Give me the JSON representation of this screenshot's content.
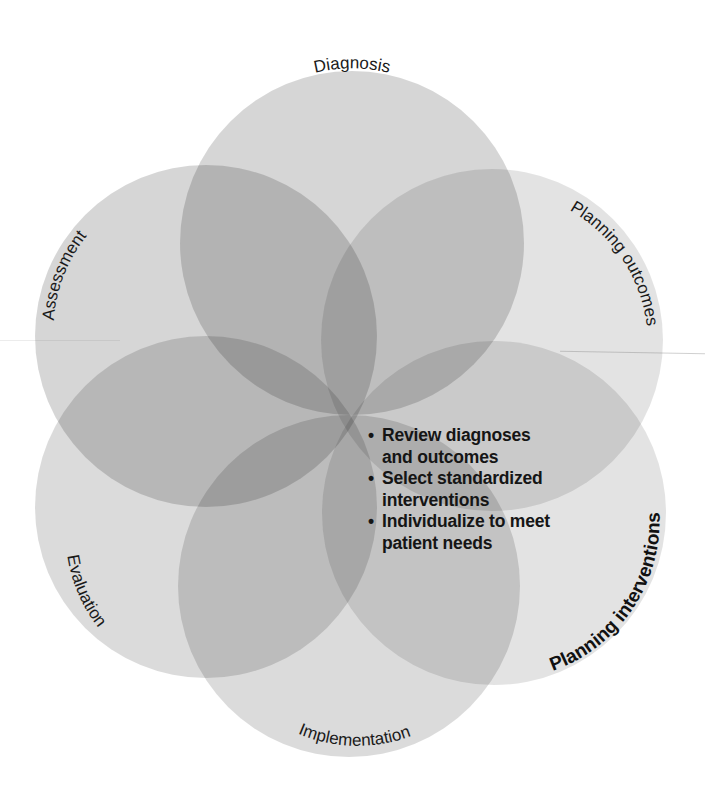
{
  "diagram": {
    "type": "overlapping-circles-rosette",
    "circles": [
      {
        "id": "diagnosis",
        "label": "Diagnosis",
        "cx": 352,
        "cy": 243,
        "r": 172,
        "opacity": 0.16,
        "emphasis": false
      },
      {
        "id": "planning-outcomes",
        "label": "Planning outcomes",
        "cx": 492,
        "cy": 340,
        "r": 171,
        "opacity": 0.11,
        "emphasis": false
      },
      {
        "id": "planning-interventions",
        "label": "Planning interventions",
        "cx": 494,
        "cy": 513,
        "r": 172,
        "opacity": 0.11,
        "emphasis": true
      },
      {
        "id": "implementation",
        "label": "Implementation",
        "cx": 349,
        "cy": 586,
        "r": 171,
        "opacity": 0.14,
        "emphasis": false
      },
      {
        "id": "evaluation",
        "label": "Evaluation",
        "cx": 206,
        "cy": 507,
        "r": 171,
        "opacity": 0.14,
        "emphasis": false
      },
      {
        "id": "assessment",
        "label": "Assessment",
        "cx": 206,
        "cy": 336,
        "r": 171,
        "opacity": 0.16,
        "emphasis": false
      }
    ],
    "fill_color": "#000000",
    "background": "#ffffff",
    "focus_circle": "planning-interventions",
    "focus_bullets": [
      {
        "line1": "Review diagnoses",
        "line2": "and outcomes"
      },
      {
        "line1": "Select standardized",
        "line2": "interventions"
      },
      {
        "line1": "Individualize to meet",
        "line2": "patient needs"
      }
    ]
  }
}
